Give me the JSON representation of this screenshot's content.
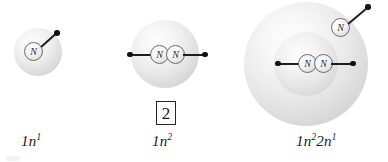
{
  "figure": {
    "type": "scientific-diagram",
    "background_color": "#ffffff",
    "nucleus_symbol": "N"
  },
  "count_badge": {
    "value": "2"
  },
  "atoms": [
    {
      "id": "atom-1",
      "label_base1": "1",
      "label_n1": "n",
      "label_sup1": "1",
      "label_plain": "1n1",
      "shell_count": 1,
      "nuclei": [
        "N"
      ],
      "electron_arms": 1
    },
    {
      "id": "atom-2",
      "label_base1": "1",
      "label_n1": "n",
      "label_sup1": "2",
      "label_plain": "1n2",
      "shell_count": 1,
      "nuclei": [
        "N",
        "N"
      ],
      "electron_arms": 2
    },
    {
      "id": "atom-3",
      "label_base1": "1",
      "label_n1": "n",
      "label_sup1": "2",
      "label_base2": "2",
      "label_n2": "n",
      "label_sup2": "1",
      "label_plain": "1n22n1",
      "shell_count": 2,
      "nuclei": [
        "N",
        "N",
        "N"
      ],
      "electron_arms": 3
    }
  ],
  "colors": {
    "ink": "#1a1a1a",
    "shell_light": "#fdfdfd",
    "shell_dark": "#c6c6c6",
    "nucleus_stroke": "#6e6e6e",
    "bond": "#1e1e1e"
  }
}
